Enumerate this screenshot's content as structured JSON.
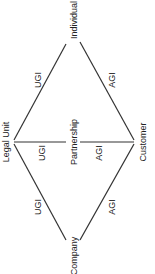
{
  "diagram": {
    "type": "entity-relationship",
    "orientation": "rotated-90-ccw",
    "colors": {
      "line": "#333333",
      "text": "#222222",
      "background": "#ffffff"
    },
    "nodes": [
      {
        "id": "legal_unit",
        "label": "Legal Unit"
      },
      {
        "id": "individual",
        "label": "Individual"
      },
      {
        "id": "partnership",
        "label": "Partnership"
      },
      {
        "id": "company",
        "label": "Company"
      },
      {
        "id": "customer",
        "label": "Customer"
      }
    ],
    "edges": [
      {
        "from": "legal_unit",
        "to": "individual",
        "label": "UGI"
      },
      {
        "from": "individual",
        "to": "customer",
        "label": "AGI"
      },
      {
        "from": "legal_unit",
        "to": "partnership",
        "label": "UGI"
      },
      {
        "from": "partnership",
        "to": "customer",
        "label": "AGI"
      },
      {
        "from": "legal_unit",
        "to": "company",
        "label": "UGI"
      },
      {
        "from": "company",
        "to": "customer",
        "label": "AGI"
      }
    ]
  }
}
